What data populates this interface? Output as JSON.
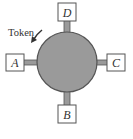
{
  "diagram": {
    "type": "token-ring-network",
    "ring": {
      "fill": "#9a9a9a",
      "stroke": "#555555"
    },
    "token": {
      "label": "Token",
      "direction": "counterclockwise"
    },
    "nodes": [
      {
        "id": "D",
        "label": "D",
        "position": "top"
      },
      {
        "id": "A",
        "label": "A",
        "position": "left"
      },
      {
        "id": "C",
        "label": "C",
        "position": "right"
      },
      {
        "id": "B",
        "label": "B",
        "position": "bottom"
      }
    ],
    "colors": {
      "box_stroke": "#555555",
      "box_fill": "#ffffff",
      "text": "#333333"
    }
  }
}
